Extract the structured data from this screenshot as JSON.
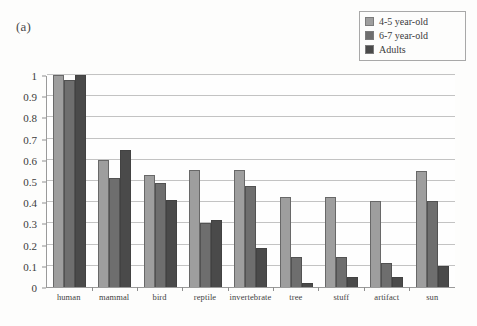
{
  "figure": {
    "panel_label": "(a)"
  },
  "legend": {
    "position": "top-right",
    "items": [
      {
        "label": "4-5 year-old",
        "color": "#9e9e9e"
      },
      {
        "label": "6-7 year-old",
        "color": "#6e6e6e"
      },
      {
        "label": "Adults",
        "color": "#4a4a4a"
      }
    ]
  },
  "axes": {
    "y_tick_labels": [
      "1",
      "0.9",
      "0.8",
      "0.7",
      "0.6",
      "0.5",
      "0.4",
      "0.3",
      "0.2",
      "0.1",
      "0"
    ],
    "x_tick_labels": [
      "human",
      "mammal",
      "bird",
      "reptile",
      "invertebrate",
      "tree",
      "stuff",
      "artifact",
      "sun"
    ]
  },
  "chart_data": {
    "type": "bar",
    "title": "",
    "subtitle": "",
    "xlabel": "",
    "ylabel": "",
    "ylim": [
      0,
      1
    ],
    "ytick_step": 0.1,
    "grid": true,
    "legend_position": "top-right",
    "categories": [
      "human",
      "mammal",
      "bird",
      "reptile",
      "invertebrate",
      "tree",
      "stuff",
      "artifact",
      "sun"
    ],
    "series": [
      {
        "name": "4-5 year-old",
        "color": "#9e9e9e",
        "values": [
          1.0,
          0.6,
          0.53,
          0.55,
          0.55,
          0.425,
          0.425,
          0.405,
          0.545
        ]
      },
      {
        "name": "6-7 year-old",
        "color": "#6e6e6e",
        "values": [
          0.975,
          0.515,
          0.49,
          0.3,
          0.475,
          0.14,
          0.14,
          0.115,
          0.405
        ]
      },
      {
        "name": "Adults",
        "color": "#4a4a4a",
        "values": [
          1.0,
          0.645,
          0.41,
          0.315,
          0.185,
          0.02,
          0.045,
          0.045,
          0.1
        ]
      }
    ]
  }
}
